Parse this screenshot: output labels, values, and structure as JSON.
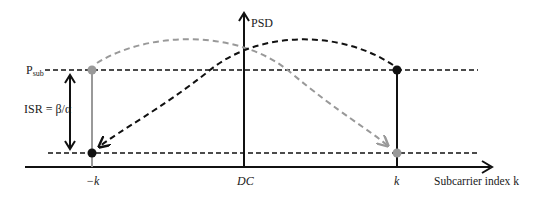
{
  "diagram": {
    "y_axis_label": "PSD",
    "x_axis_label": "Subcarrier index k",
    "level_label_main": "P",
    "level_label_sub": "sub",
    "isr_label": "ISR = β/α",
    "tick_neg_k": "−k",
    "tick_dc": "DC",
    "tick_pos_k": "k",
    "colors": {
      "black": "#111111",
      "gray": "#999999"
    },
    "points": {
      "neg_k_upper": {
        "color": "gray",
        "level": "P_sub"
      },
      "neg_k_lower": {
        "color": "black",
        "level": "low"
      },
      "pos_k_upper": {
        "color": "black",
        "level": "P_sub"
      },
      "pos_k_lower": {
        "color": "gray",
        "level": "low"
      }
    },
    "arrows": [
      {
        "from": "k",
        "to": "-k",
        "style": "black dashed arc"
      },
      {
        "from": "-k",
        "to": "k",
        "style": "gray dashed arc"
      }
    ]
  }
}
